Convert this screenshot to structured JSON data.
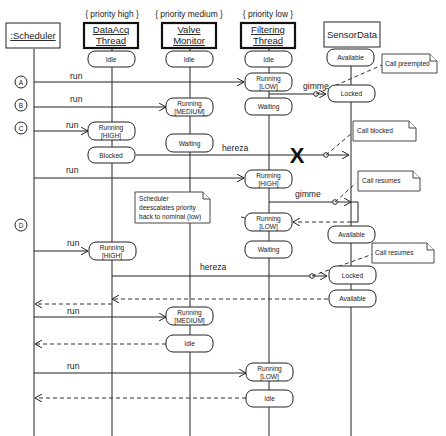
{
  "diagram": {
    "type": "UML sequence/timing diagram",
    "lifelines": [
      {
        "id": "scheduler",
        "label": ":Scheduler",
        "priority": ""
      },
      {
        "id": "dataacq",
        "label_line1": "DataAcq",
        "label_line2": "Thread",
        "priority": "{ priority high }"
      },
      {
        "id": "valve",
        "label_line1": "Valve",
        "label_line2": "Monitor",
        "priority": "{ priority medium }"
      },
      {
        "id": "filtering",
        "label_line1": "Filtering",
        "label_line2": "Thread",
        "priority": "{ priority low }"
      },
      {
        "id": "sensordata",
        "label": "SensorData",
        "priority": ""
      }
    ],
    "markers": [
      "A",
      "B",
      "C",
      "D"
    ],
    "states": {
      "idle": "Idle",
      "available": "Available",
      "locked": "Locked",
      "waiting": "Waiting",
      "blocked": "Blocked",
      "running": "Running",
      "low": "[LOW]",
      "medium": "[MEDIUM]",
      "high": "[HIGH]"
    },
    "messages": {
      "run": "run",
      "gimme": "gimme",
      "hereza": "hereza"
    },
    "notes": {
      "call_preempted": "Call preempted",
      "call_blocked": "Call blocked",
      "call_resumes_1": "Call resumes",
      "call_resumes_2": "Call resumes",
      "deescalate_line1": "Scheduler",
      "deescalate_line2": "deescalates priority",
      "deescalate_line3": "back to nominal (low)"
    },
    "destroy_marker": "X"
  }
}
